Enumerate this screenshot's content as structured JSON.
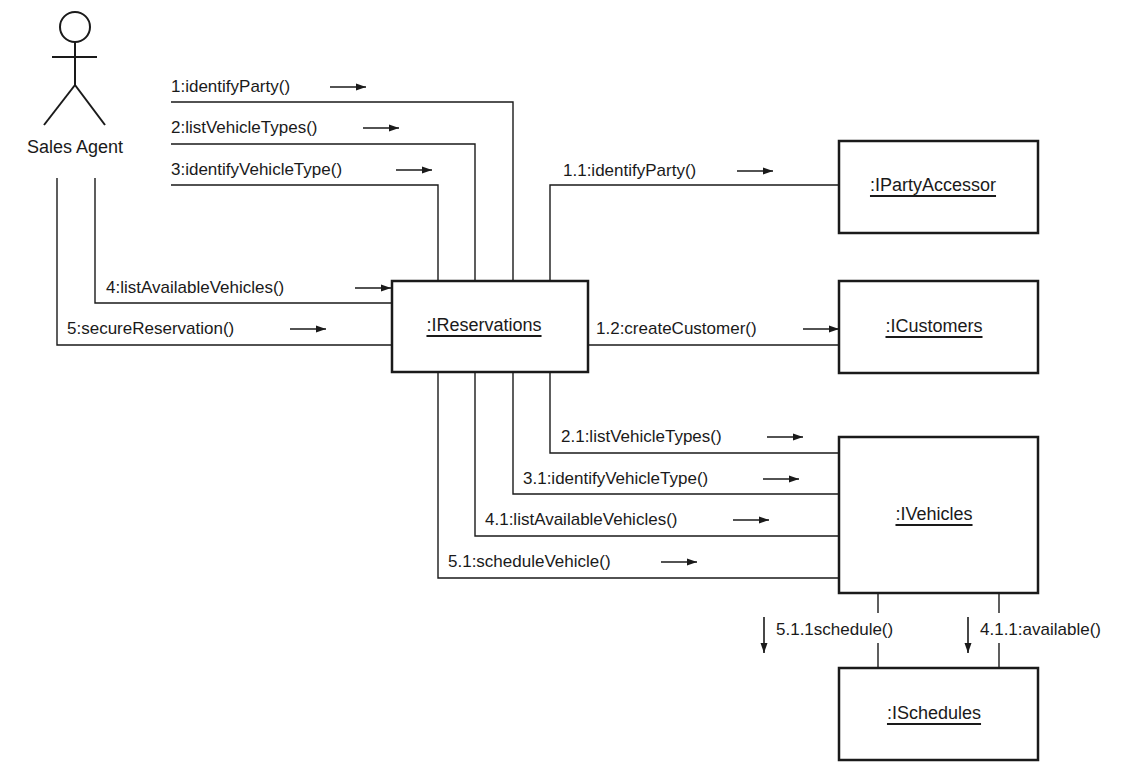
{
  "diagram": {
    "type": "UML collaboration diagram",
    "actor": {
      "name": "Sales Agent"
    },
    "objects": {
      "reservations": ":IReservations",
      "party_accessor": ":IPartyAccessor",
      "customers": ":ICustomers",
      "vehicles": ":IVehicles",
      "schedules": ":ISchedules"
    },
    "messages": {
      "m1": "1:identifyParty()",
      "m2": "2:listVehicleTypes()",
      "m3": "3:identifyVehicleType()",
      "m4": "4:listAvailableVehicles()",
      "m5": "5:secureReservation()",
      "m1_1": "1.1:identifyParty()",
      "m1_2": "1.2:createCustomer()",
      "m2_1": "2.1:listVehicleTypes()",
      "m3_1": "3.1:identifyVehicleType()",
      "m4_1": "4.1:listAvailableVehicles()",
      "m5_1": "5.1:scheduleVehicle()",
      "m5_1_1": "5.1.1schedule()",
      "m4_1_1": "4.1.1:available()"
    },
    "colors": {
      "ink": "#1a1a1a",
      "background": "#ffffff"
    }
  }
}
